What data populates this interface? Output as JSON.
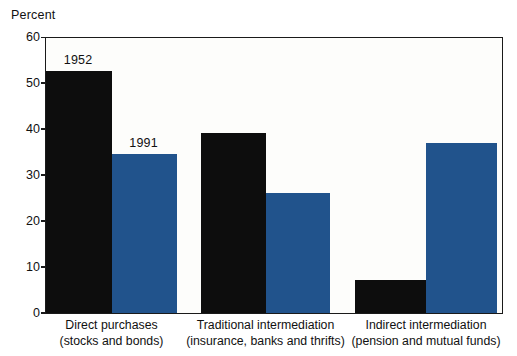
{
  "chart_data": {
    "type": "bar",
    "title": "",
    "subtitle": "",
    "xlabel": "",
    "ylabel": "Percent",
    "ylim": [
      0,
      60
    ],
    "yticks": [
      "0",
      "10",
      "20",
      "30",
      "40",
      "50",
      "60"
    ],
    "grid": false,
    "legend_position": "inline-annotation",
    "categories": [
      "Direct purchases (stocks and bonds)",
      "Traditional intermediation (insurance, banks and thrifts)",
      "Indirect intermediation (pension and mutual funds)"
    ],
    "category_lines": [
      [
        "Direct purchases",
        "(stocks and bonds)"
      ],
      [
        "Traditional intermediation",
        "(insurance, banks and thrifts)"
      ],
      [
        "Indirect intermediation",
        "(pension and mutual funds)"
      ]
    ],
    "series": [
      {
        "name": "1952",
        "color": "#0d0d0d",
        "values": [
          52.5,
          39.0,
          7.0
        ]
      },
      {
        "name": "1991",
        "color": "#21538c",
        "values": [
          34.5,
          26.0,
          37.0
        ]
      }
    ],
    "annotations": [
      {
        "text": "1952",
        "series": "1952",
        "group": 0
      },
      {
        "text": "1991",
        "series": "1991",
        "group": 0
      }
    ]
  },
  "axis": {
    "y_title": "Percent"
  }
}
